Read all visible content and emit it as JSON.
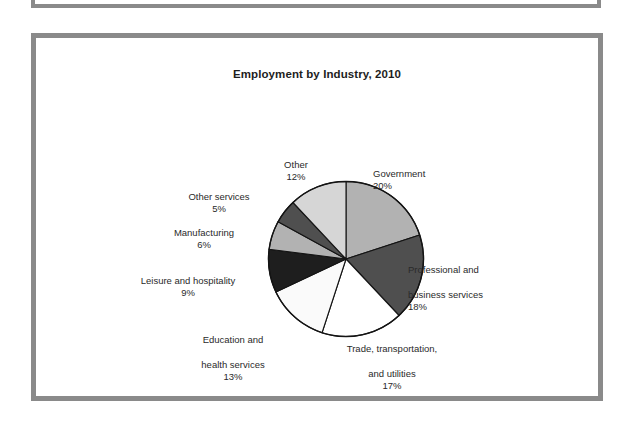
{
  "figure": {
    "title": "Employment by Industry, 2010"
  },
  "chart_data": {
    "type": "pie",
    "title": "Employment by Industry, 2010",
    "xlabel": "",
    "ylabel": "",
    "units": "percent",
    "total": 100,
    "start_angle_deg": 0,
    "direction": "clockwise",
    "legend": "none (direct callout labels)",
    "grid": false,
    "categories": [
      "Government",
      "Professional and business services",
      "Trade, transportation, and utilities",
      "Education and health services",
      "Leisure and hospitality",
      "Manufacturing",
      "Other services",
      "Other"
    ],
    "values": [
      20,
      18,
      17,
      13,
      9,
      6,
      5,
      12
    ],
    "slices": [
      {
        "name": "Government",
        "label_lines": [
          "Government"
        ],
        "value": 20,
        "pct_text": "20%",
        "color": "#b2b2b2"
      },
      {
        "name": "Professional and business services",
        "label_lines": [
          "Professional and",
          "business services"
        ],
        "value": 18,
        "pct_text": "18%",
        "color": "#4f4f4f"
      },
      {
        "name": "Trade, transportation, and utilities",
        "label_lines": [
          "Trade, transportation,",
          "and utilities"
        ],
        "value": 17,
        "pct_text": "17%",
        "color": "#ffffff"
      },
      {
        "name": "Education and health services",
        "label_lines": [
          "Education and",
          "health services"
        ],
        "value": 13,
        "pct_text": "13%",
        "color": "#fafafa"
      },
      {
        "name": "Leisure and hospitality",
        "label_lines": [
          "Leisure and hospitality"
        ],
        "value": 9,
        "pct_text": "9%",
        "color": "#1e1e1e"
      },
      {
        "name": "Manufacturing",
        "label_lines": [
          "Manufacturing"
        ],
        "value": 6,
        "pct_text": "6%",
        "color": "#b2b2b2"
      },
      {
        "name": "Other services",
        "label_lines": [
          "Other services"
        ],
        "value": 5,
        "pct_text": "5%",
        "color": "#4f4f4f"
      },
      {
        "name": "Other",
        "label_lines": [
          "Other"
        ],
        "value": 12,
        "pct_text": "12%",
        "color": "#d6d6d6"
      }
    ]
  },
  "labels": {
    "government": {
      "name": "Government",
      "pct": "20%"
    },
    "professional": {
      "line1": "Professional and",
      "line2": "business services",
      "pct": "18%"
    },
    "trade": {
      "line1": "Trade, transportation,",
      "line2": "and utilities",
      "pct": "17%"
    },
    "education": {
      "line1": "Education and",
      "line2": "health services",
      "pct": "13%"
    },
    "leisure": {
      "name": "Leisure and hospitality",
      "pct": "9%"
    },
    "manufacturing": {
      "name": "Manufacturing",
      "pct": "6%"
    },
    "otherservices": {
      "name": "Other services",
      "pct": "5%"
    },
    "other": {
      "name": "Other",
      "pct": "12%"
    }
  },
  "style": {
    "frame_color": "#8a8a8a",
    "outline_color": "#141414",
    "background": "#ffffff"
  }
}
